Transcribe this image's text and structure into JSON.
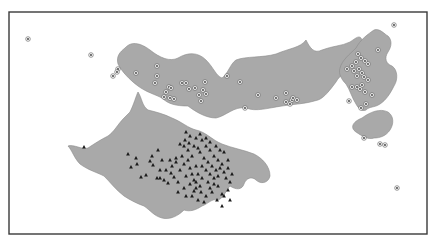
{
  "figure": {
    "width": 435,
    "height": 244,
    "frame": {
      "x": 9,
      "y": 12,
      "w": 418,
      "h": 222
    },
    "colors": {
      "region_fill": "#a9a9a9",
      "frame": "#3a3a3a",
      "triangle": "#1a1a1a",
      "circle_marker": "#555555"
    },
    "legend": null,
    "title": null
  },
  "regions": [
    {
      "name": "north-region",
      "path": "M125,48 C132,40 142,44 150,50 C160,58 170,62 178,58 C188,52 198,52 206,60 C214,68 216,76 222,78 C228,74 230,64 236,60 C246,56 262,58 276,54 C290,48 300,48 306,40 C310,48 314,54 322,50 C332,46 342,46 350,42 C356,38 360,34 362,40 C366,46 364,56 358,62 C350,70 340,74 336,82 C330,90 324,98 318,100 C306,104 294,104 282,106 C268,108 256,112 246,108 C234,106 226,116 216,118 C206,118 196,112 188,106 C176,106 168,104 162,98 C154,94 146,92 138,86 C130,80 122,72 118,64 C116,56 120,52 125,48 Z"
    },
    {
      "name": "northeast-region",
      "path": "M356,48 C360,40 368,34 374,30 C380,28 384,34 388,36 C392,40 392,46 388,52 C384,58 386,64 392,66 C398,70 398,80 394,86 C390,94 386,100 380,104 C374,108 370,106 366,110 C362,112 358,108 356,104 C352,98 350,90 346,84 C342,80 338,74 340,68 C342,60 350,54 356,48 Z"
    },
    {
      "name": "east-island",
      "path": "M362,118 C370,112 380,108 388,112 C394,116 394,124 390,130 C386,136 380,138 374,138 C368,140 362,136 356,132 C350,128 352,122 362,118 Z"
    },
    {
      "name": "south-region",
      "path": "M130,112 C134,104 136,96 138,92 C142,98 142,106 148,110 C156,112 164,114 172,118 C182,122 188,128 196,130 C206,132 212,140 222,144 C232,148 244,150 254,154 C262,158 270,166 270,176 C268,184 260,184 256,180 C252,176 246,178 244,184 C242,190 236,190 230,186 C226,190 224,198 218,200 C212,198 208,204 202,206 C196,210 190,212 184,210 C178,216 170,220 162,218 C154,216 150,210 144,206 C138,204 130,200 124,196 C116,190 110,182 104,176 C96,172 88,170 80,164 C74,158 72,150 68,146 C74,144 82,150 88,148 C94,144 100,140 108,136 C114,132 118,124 124,118 C126,116 128,114 130,112 Z"
    }
  ],
  "circle_points": [
    [
      28,
      39
    ],
    [
      91,
      55
    ],
    [
      118,
      69
    ],
    [
      117,
      72
    ],
    [
      113,
      76
    ],
    [
      136,
      73
    ],
    [
      157,
      66
    ],
    [
      157,
      76
    ],
    [
      155,
      83
    ],
    [
      169,
      87
    ],
    [
      171,
      88
    ],
    [
      166,
      92
    ],
    [
      164,
      97
    ],
    [
      170,
      98
    ],
    [
      174,
      99
    ],
    [
      182,
      83
    ],
    [
      186,
      83
    ],
    [
      189,
      89
    ],
    [
      195,
      88
    ],
    [
      203,
      90
    ],
    [
      206,
      94
    ],
    [
      205,
      82
    ],
    [
      199,
      95
    ],
    [
      201,
      101
    ],
    [
      227,
      76
    ],
    [
      240,
      82
    ],
    [
      286,
      93
    ],
    [
      276,
      98
    ],
    [
      286,
      102
    ],
    [
      290,
      104
    ],
    [
      292,
      100
    ],
    [
      293,
      98
    ],
    [
      297,
      100
    ],
    [
      258,
      95
    ],
    [
      245,
      108
    ],
    [
      394,
      25
    ],
    [
      378,
      50
    ],
    [
      358,
      54
    ],
    [
      361,
      58
    ],
    [
      365,
      61
    ],
    [
      368,
      64
    ],
    [
      356,
      62
    ],
    [
      352,
      66
    ],
    [
      347,
      69
    ],
    [
      359,
      69
    ],
    [
      354,
      71
    ],
    [
      362,
      73
    ],
    [
      357,
      76
    ],
    [
      364,
      77
    ],
    [
      368,
      80
    ],
    [
      362,
      85
    ],
    [
      357,
      87
    ],
    [
      352,
      87
    ],
    [
      360,
      89
    ],
    [
      365,
      92
    ],
    [
      349,
      101
    ],
    [
      366,
      104
    ],
    [
      361,
      108
    ],
    [
      372,
      95
    ],
    [
      380,
      144
    ],
    [
      385,
      145
    ],
    [
      397,
      188
    ],
    [
      364,
      138
    ]
  ],
  "triangle_points": [
    [
      84,
      147
    ],
    [
      128,
      154
    ],
    [
      136,
      158
    ],
    [
      137,
      164
    ],
    [
      131,
      167
    ],
    [
      150,
      161
    ],
    [
      153,
      165
    ],
    [
      146,
      175
    ],
    [
      141,
      177
    ],
    [
      157,
      178
    ],
    [
      160,
      178
    ],
    [
      164,
      180
    ],
    [
      171,
      173
    ],
    [
      168,
      183
    ],
    [
      174,
      177
    ],
    [
      178,
      182
    ],
    [
      184,
      188
    ],
    [
      190,
      184
    ],
    [
      194,
      191
    ],
    [
      196,
      188
    ],
    [
      201,
      192
    ],
    [
      206,
      196
    ],
    [
      212,
      192
    ],
    [
      218,
      186
    ],
    [
      222,
      194
    ],
    [
      180,
      144
    ],
    [
      185,
      140
    ],
    [
      189,
      143
    ],
    [
      194,
      146
    ],
    [
      198,
      148
    ],
    [
      200,
      152
    ],
    [
      192,
      156
    ],
    [
      188,
      160
    ],
    [
      184,
      164
    ],
    [
      190,
      168
    ],
    [
      196,
      166
    ],
    [
      202,
      166
    ],
    [
      206,
      170
    ],
    [
      210,
      174
    ],
    [
      214,
      178
    ],
    [
      208,
      182
    ],
    [
      202,
      178
    ],
    [
      198,
      174
    ],
    [
      194,
      180
    ],
    [
      186,
      176
    ],
    [
      180,
      170
    ],
    [
      176,
      162
    ],
    [
      182,
      156
    ],
    [
      188,
      150
    ],
    [
      184,
      146
    ],
    [
      204,
      158
    ],
    [
      208,
      162
    ],
    [
      212,
      166
    ],
    [
      216,
      170
    ],
    [
      218,
      176
    ],
    [
      214,
      184
    ],
    [
      210,
      188
    ],
    [
      200,
      186
    ],
    [
      196,
      182
    ],
    [
      192,
      174
    ],
    [
      220,
      168
    ],
    [
      224,
      172
    ],
    [
      226,
      178
    ],
    [
      228,
      190
    ],
    [
      224,
      196
    ],
    [
      217,
      200
    ],
    [
      166,
      170
    ],
    [
      172,
      166
    ],
    [
      176,
      158
    ],
    [
      170,
      160
    ],
    [
      160,
      170
    ],
    [
      206,
      146
    ],
    [
      210,
      150
    ],
    [
      214,
      156
    ],
    [
      218,
      160
    ],
    [
      222,
      164
    ],
    [
      228,
      168
    ],
    [
      232,
      174
    ],
    [
      230,
      182
    ],
    [
      228,
      160
    ],
    [
      224,
      152
    ],
    [
      202,
      140
    ],
    [
      196,
      138
    ],
    [
      190,
      136
    ],
    [
      186,
      132
    ],
    [
      200,
      134
    ],
    [
      206,
      138
    ],
    [
      210,
      142
    ],
    [
      216,
      146
    ],
    [
      220,
      150
    ],
    [
      152,
      156
    ],
    [
      158,
      150
    ],
    [
      162,
      160
    ],
    [
      230,
      200
    ],
    [
      222,
      206
    ],
    [
      178,
      192
    ],
    [
      186,
      196
    ],
    [
      192,
      196
    ],
    [
      198,
      200
    ],
    [
      204,
      202
    ]
  ]
}
